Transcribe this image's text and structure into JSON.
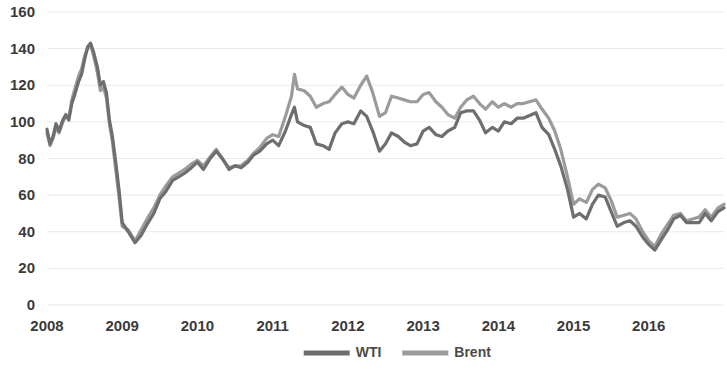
{
  "chart_data": {
    "type": "line",
    "title": "",
    "xlabel": "",
    "ylabel": "",
    "ylim": [
      0,
      160
    ],
    "ytick_step": 20,
    "yticks": [
      "0",
      "20",
      "40",
      "60",
      "80",
      "100",
      "120",
      "140",
      "160"
    ],
    "xticks": [
      "2008",
      "2009",
      "2010",
      "2011",
      "2012",
      "2013",
      "2014",
      "2015",
      "2016"
    ],
    "xlim": [
      2008,
      2017.0
    ],
    "grid": true,
    "grid_axis": "y",
    "legend_position": "bottom-center",
    "series": [
      {
        "name": "WTI",
        "color": "#6e6e6e",
        "x": [
          2008.0,
          2008.04,
          2008.08,
          2008.12,
          2008.16,
          2008.21,
          2008.25,
          2008.29,
          2008.33,
          2008.37,
          2008.42,
          2008.46,
          2008.5,
          2008.54,
          2008.58,
          2008.62,
          2008.67,
          2008.71,
          2008.75,
          2008.79,
          2008.83,
          2008.87,
          2008.92,
          2008.96,
          2009.0,
          2009.08,
          2009.17,
          2009.25,
          2009.33,
          2009.42,
          2009.5,
          2009.58,
          2009.67,
          2009.75,
          2009.83,
          2009.92,
          2010.0,
          2010.08,
          2010.17,
          2010.25,
          2010.33,
          2010.42,
          2010.5,
          2010.58,
          2010.67,
          2010.75,
          2010.83,
          2010.92,
          2011.0,
          2011.08,
          2011.17,
          2011.25,
          2011.29,
          2011.33,
          2011.42,
          2011.5,
          2011.58,
          2011.67,
          2011.75,
          2011.83,
          2011.92,
          2012.0,
          2012.08,
          2012.17,
          2012.25,
          2012.33,
          2012.42,
          2012.5,
          2012.58,
          2012.67,
          2012.75,
          2012.83,
          2012.92,
          2013.0,
          2013.08,
          2013.17,
          2013.25,
          2013.33,
          2013.42,
          2013.5,
          2013.58,
          2013.67,
          2013.75,
          2013.83,
          2013.92,
          2014.0,
          2014.08,
          2014.17,
          2014.25,
          2014.33,
          2014.5,
          2014.58,
          2014.67,
          2014.75,
          2014.83,
          2014.92,
          2015.0,
          2015.08,
          2015.17,
          2015.25,
          2015.33,
          2015.42,
          2015.5,
          2015.58,
          2015.67,
          2015.75,
          2015.83,
          2015.92,
          2016.0,
          2016.08,
          2016.17,
          2016.25,
          2016.33,
          2016.42,
          2016.5,
          2016.58,
          2016.67,
          2016.75,
          2016.83,
          2016.92,
          2017.0
        ],
        "y": [
          96,
          88,
          92,
          99,
          95,
          101,
          104,
          101,
          110,
          115,
          122,
          126,
          134,
          141,
          143,
          138,
          130,
          120,
          122,
          116,
          101,
          92,
          76,
          62,
          45,
          40,
          34,
          38,
          44,
          50,
          58,
          62,
          68,
          70,
          72,
          75,
          78,
          74,
          80,
          84,
          80,
          74,
          76,
          75,
          78,
          82,
          84,
          88,
          90,
          87,
          95,
          104,
          108,
          100,
          98,
          97,
          88,
          87,
          85,
          94,
          99,
          100,
          99,
          106,
          103,
          95,
          84,
          88,
          94,
          92,
          89,
          87,
          88,
          95,
          97,
          93,
          92,
          95,
          97,
          105,
          106,
          106,
          101,
          94,
          97,
          95,
          100,
          99,
          102,
          102,
          105,
          97,
          93,
          85,
          76,
          63,
          48,
          50,
          47,
          55,
          60,
          59,
          51,
          43,
          45,
          46,
          43,
          37,
          33,
          30,
          36,
          41,
          47,
          49,
          45,
          45,
          45,
          50,
          46,
          51,
          53
        ]
      },
      {
        "name": "Brent",
        "color": "#9b9b9b",
        "x": [
          2008.0,
          2008.04,
          2008.08,
          2008.12,
          2008.16,
          2008.21,
          2008.25,
          2008.29,
          2008.33,
          2008.37,
          2008.42,
          2008.46,
          2008.5,
          2008.54,
          2008.58,
          2008.62,
          2008.67,
          2008.71,
          2008.75,
          2008.79,
          2008.83,
          2008.87,
          2008.92,
          2008.96,
          2009.0,
          2009.08,
          2009.17,
          2009.25,
          2009.33,
          2009.42,
          2009.5,
          2009.58,
          2009.67,
          2009.75,
          2009.83,
          2009.92,
          2010.0,
          2010.08,
          2010.17,
          2010.25,
          2010.33,
          2010.42,
          2010.5,
          2010.58,
          2010.67,
          2010.75,
          2010.83,
          2010.92,
          2011.0,
          2011.08,
          2011.17,
          2011.25,
          2011.29,
          2011.33,
          2011.42,
          2011.5,
          2011.58,
          2011.67,
          2011.75,
          2011.83,
          2011.92,
          2012.0,
          2012.08,
          2012.17,
          2012.25,
          2012.33,
          2012.42,
          2012.5,
          2012.58,
          2012.67,
          2012.75,
          2012.83,
          2012.92,
          2013.0,
          2013.08,
          2013.17,
          2013.25,
          2013.33,
          2013.42,
          2013.5,
          2013.58,
          2013.67,
          2013.75,
          2013.83,
          2013.92,
          2014.0,
          2014.08,
          2014.17,
          2014.25,
          2014.33,
          2014.5,
          2014.58,
          2014.67,
          2014.75,
          2014.83,
          2014.92,
          2015.0,
          2015.08,
          2015.17,
          2015.25,
          2015.33,
          2015.42,
          2015.5,
          2015.58,
          2015.67,
          2015.75,
          2015.83,
          2015.92,
          2016.0,
          2016.08,
          2016.17,
          2016.25,
          2016.33,
          2016.42,
          2016.5,
          2016.58,
          2016.67,
          2016.75,
          2016.83,
          2016.92,
          2017.0
        ],
        "y": [
          94,
          87,
          91,
          97,
          94,
          100,
          103,
          102,
          112,
          118,
          125,
          129,
          136,
          140,
          142,
          136,
          127,
          117,
          119,
          113,
          99,
          89,
          72,
          58,
          43,
          41,
          35,
          41,
          47,
          53,
          60,
          65,
          70,
          72,
          74,
          77,
          79,
          76,
          81,
          85,
          80,
          75,
          76,
          76,
          79,
          83,
          86,
          91,
          93,
          92,
          103,
          114,
          126,
          118,
          117,
          114,
          108,
          110,
          111,
          115,
          119,
          115,
          113,
          120,
          125,
          116,
          103,
          105,
          114,
          113,
          112,
          111,
          111,
          115,
          116,
          111,
          108,
          104,
          102,
          108,
          112,
          114,
          110,
          107,
          111,
          108,
          110,
          108,
          110,
          110,
          112,
          107,
          102,
          95,
          85,
          70,
          55,
          58,
          56,
          63,
          66,
          64,
          57,
          48,
          49,
          50,
          47,
          40,
          35,
          32,
          39,
          44,
          49,
          50,
          46,
          47,
          48,
          52,
          48,
          53,
          55
        ]
      }
    ]
  },
  "legend": {
    "items": [
      {
        "label": "WTI",
        "color": "#6e6e6e"
      },
      {
        "label": "Brent",
        "color": "#9b9b9b"
      }
    ]
  }
}
